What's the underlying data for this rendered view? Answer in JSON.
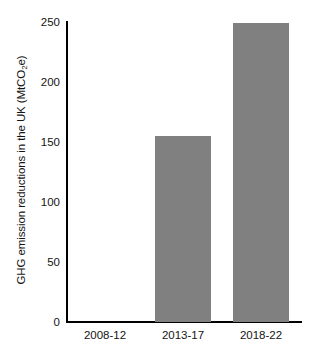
{
  "chart_data": {
    "type": "bar",
    "title": "",
    "xlabel": "",
    "ylabel": "GHG emission reductions in the UK (MtCO2e)",
    "ylabel_parts": {
      "pre": "GHG emission reductions in the UK (MtCO",
      "sub": "2",
      "post": "e)"
    },
    "categories": [
      "2008-12",
      "2013-17",
      "2018-22"
    ],
    "values": [
      0,
      155,
      249
    ],
    "ylim": [
      0,
      250
    ],
    "yticks": [
      0,
      50,
      100,
      150,
      200,
      250
    ],
    "ytick_labels": [
      "0",
      "50",
      "100",
      "150",
      "200",
      "250"
    ],
    "grid": false,
    "legend": null,
    "bar_color": "#808080",
    "axis_color": "#000000",
    "background_color": "#ffffff"
  }
}
